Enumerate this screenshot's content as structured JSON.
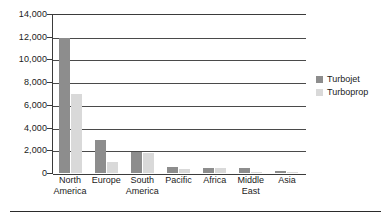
{
  "chart_data": {
    "type": "bar",
    "title": "",
    "subtitle": "",
    "xlabel": "",
    "ylabel": "",
    "categories": [
      "North America",
      "Europe",
      "South America",
      "Pacific",
      "Africa",
      "Middle East",
      "Asia"
    ],
    "category_lines": [
      [
        "North",
        "America"
      ],
      [
        "Europe",
        ""
      ],
      [
        "South",
        "America"
      ],
      [
        "Pacific",
        ""
      ],
      [
        "Africa",
        ""
      ],
      [
        "Middle",
        "East"
      ],
      [
        "Asia",
        ""
      ]
    ],
    "series": [
      {
        "name": "Turbojet",
        "color": "#8d8d8d",
        "values": [
          11900,
          2900,
          1850,
          550,
          420,
          400,
          150
        ]
      },
      {
        "name": "Turboprop",
        "color": "#d9d9d9",
        "values": [
          6950,
          1000,
          1800,
          380,
          400,
          30,
          60
        ]
      }
    ],
    "ylim": [
      0,
      14000
    ],
    "ytick_values": [
      0,
      2000,
      4000,
      6000,
      8000,
      10000,
      12000,
      14000
    ],
    "ytick_labels": [
      "0",
      "2,000",
      "4,000",
      "6,000",
      "8,000",
      "10,000",
      "12,000",
      "14,000"
    ],
    "grid": "horizontal",
    "legend_position": "right",
    "legend_entries": [
      "Turbojet",
      "Turboprop"
    ]
  }
}
